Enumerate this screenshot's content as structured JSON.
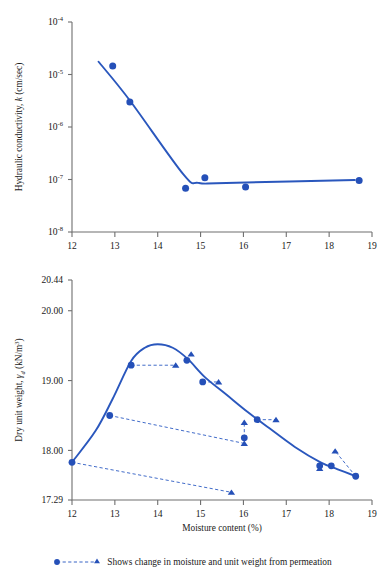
{
  "figure": {
    "legend_text": "Shows change in moisture and unit weight from permeation",
    "accent_color": "#2550b8",
    "axis_color": "#6f6f6f"
  },
  "chart_data": [
    {
      "type": "scatter",
      "id": "hydraulic-conductivity",
      "title": "",
      "xlabel": "",
      "ylabel": "Hydraulic conductivity, k (cm/sec)",
      "ylabel_parts": {
        "text": "Hydraulic conductivity, ",
        "italic": "k",
        "tail": " (cm/sec)"
      },
      "yscale": "log",
      "xlim": [
        12,
        19
      ],
      "ylim": [
        1e-08,
        0.0001
      ],
      "xticks": [
        12,
        13,
        14,
        15,
        16,
        17,
        18,
        19
      ],
      "xticklabels": [
        "12",
        "13",
        "14",
        "15",
        "16",
        "17",
        "18",
        "19"
      ],
      "yticks": [
        0.0001,
        1e-05,
        1e-06,
        1e-07,
        1e-08
      ],
      "yticklabels": [
        "10-4",
        "10-5",
        "10-6",
        "10-7",
        "10-8"
      ],
      "yticklabel_exponents": [
        "-4",
        "-5",
        "-6",
        "-7",
        "-8"
      ],
      "grid": false,
      "points": [
        {
          "x": 12.95,
          "y": 1.45e-05
        },
        {
          "x": 13.35,
          "y": 3e-06
        },
        {
          "x": 14.65,
          "y": 6.8e-08
        },
        {
          "x": 15.1,
          "y": 1.08e-07
        },
        {
          "x": 16.05,
          "y": 7.2e-08
        },
        {
          "x": 18.7,
          "y": 9.6e-08
        }
      ],
      "fit_line": [
        {
          "x": 12.62,
          "y": 1.75e-05
        },
        {
          "x": 13.35,
          "y": 3.2e-06
        },
        {
          "x": 14.6,
          "y": 1.25e-07
        },
        {
          "x": 14.95,
          "y": 8.6e-08
        },
        {
          "x": 15.6,
          "y": 8.6e-08
        },
        {
          "x": 18.6,
          "y": 9.8e-08
        }
      ]
    },
    {
      "type": "scatter",
      "id": "compaction-curve",
      "title": "",
      "xlabel": "Moisture content (%)",
      "ylabel": "Dry unit weight, γd (kN/m3)",
      "ylabel_parts": {
        "text": "Dry unit weight, ",
        "italic": "γ",
        "sub": "d",
        "tail": " (kN/m",
        "sup": "3",
        "tail2": ")"
      },
      "yscale": "linear",
      "xlim": [
        12,
        19
      ],
      "ylim": [
        17.29,
        20.44
      ],
      "xticks": [
        12,
        13,
        14,
        15,
        16,
        17,
        18,
        19
      ],
      "xticklabels": [
        "12",
        "13",
        "14",
        "15",
        "16",
        "17",
        "18",
        "19"
      ],
      "yticks": [
        20.44,
        20.0,
        19.0,
        18.0,
        17.29
      ],
      "yticklabels": [
        "20.44",
        "20.00",
        "19.00",
        "18.00",
        "17.29"
      ],
      "grid": false,
      "circles": [
        {
          "x": 12.0,
          "y": 17.83
        },
        {
          "x": 12.88,
          "y": 18.5
        },
        {
          "x": 13.38,
          "y": 19.22
        },
        {
          "x": 14.68,
          "y": 19.29
        },
        {
          "x": 15.05,
          "y": 18.98
        },
        {
          "x": 16.02,
          "y": 18.18
        },
        {
          "x": 16.32,
          "y": 18.44
        },
        {
          "x": 17.78,
          "y": 17.78
        },
        {
          "x": 18.05,
          "y": 17.78
        },
        {
          "x": 18.62,
          "y": 17.63
        }
      ],
      "triangles": [
        {
          "x": 14.42,
          "y": 19.22
        },
        {
          "x": 14.78,
          "y": 19.38
        },
        {
          "x": 15.42,
          "y": 18.98
        },
        {
          "x": 15.72,
          "y": 17.4
        },
        {
          "x": 16.02,
          "y": 18.4
        },
        {
          "x": 16.02,
          "y": 18.1
        },
        {
          "x": 16.76,
          "y": 18.44
        },
        {
          "x": 17.78,
          "y": 17.74
        },
        {
          "x": 18.14,
          "y": 17.99
        }
      ],
      "permeation_links": [
        {
          "from": {
            "x": 13.38,
            "y": 19.22
          },
          "to": {
            "x": 14.42,
            "y": 19.22
          }
        },
        {
          "from": {
            "x": 12.88,
            "y": 18.5
          },
          "to": {
            "x": 16.02,
            "y": 18.1
          }
        },
        {
          "from": {
            "x": 12.0,
            "y": 17.83
          },
          "to": {
            "x": 15.72,
            "y": 17.4
          }
        },
        {
          "from": {
            "x": 16.02,
            "y": 18.18
          },
          "to": {
            "x": 16.02,
            "y": 18.4
          }
        },
        {
          "from": {
            "x": 16.32,
            "y": 18.44
          },
          "to": {
            "x": 16.76,
            "y": 18.44
          }
        },
        {
          "from": {
            "x": 15.05,
            "y": 18.98
          },
          "to": {
            "x": 15.42,
            "y": 18.98
          }
        },
        {
          "from": {
            "x": 18.62,
            "y": 17.63
          },
          "to": {
            "x": 18.14,
            "y": 17.99
          }
        }
      ],
      "fit_curve": [
        {
          "x": 12.0,
          "y": 17.83
        },
        {
          "x": 12.55,
          "y": 18.28
        },
        {
          "x": 12.95,
          "y": 18.74
        },
        {
          "x": 13.38,
          "y": 19.28
        },
        {
          "x": 13.7,
          "y": 19.47
        },
        {
          "x": 14.0,
          "y": 19.52
        },
        {
          "x": 14.35,
          "y": 19.47
        },
        {
          "x": 14.7,
          "y": 19.31
        },
        {
          "x": 15.1,
          "y": 19.05
        },
        {
          "x": 15.6,
          "y": 18.8
        },
        {
          "x": 16.1,
          "y": 18.55
        },
        {
          "x": 16.6,
          "y": 18.32
        },
        {
          "x": 17.2,
          "y": 18.05
        },
        {
          "x": 17.8,
          "y": 17.83
        },
        {
          "x": 18.2,
          "y": 17.73
        },
        {
          "x": 18.62,
          "y": 17.63
        }
      ]
    }
  ]
}
